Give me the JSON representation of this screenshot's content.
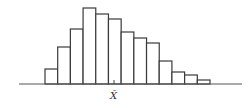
{
  "chart_data": {
    "type": "bar",
    "subtype": "histogram",
    "title": "",
    "xlabel": "",
    "ylabel": "",
    "categories": [
      "1",
      "2",
      "3",
      "4",
      "5",
      "6",
      "7",
      "8",
      "9",
      "10",
      "11",
      "12",
      "13"
    ],
    "values": [
      15,
      37,
      55,
      76,
      70,
      65,
      52,
      46,
      41,
      23,
      12,
      9,
      4
    ],
    "annotations": [
      {
        "label": "X̄",
        "meaning": "sample mean",
        "position_bin": 6.5
      }
    ],
    "grid": false,
    "legend": null,
    "axes_visible": {
      "x_baseline": true,
      "y": false
    }
  },
  "labels": {
    "mean": "X̄"
  },
  "colors": {
    "bar_fill": "#ffffff",
    "bar_stroke": "#3a3a3a",
    "axis": "#555555"
  }
}
